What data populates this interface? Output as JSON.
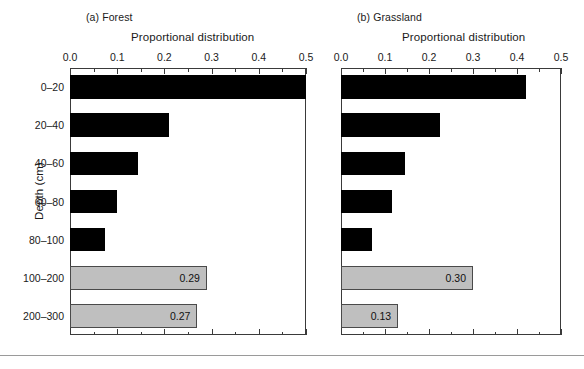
{
  "figure": {
    "y_axis_title": "Depth (cm)",
    "bottom_rule": "horizontal-rule"
  },
  "panels": [
    {
      "id": "a",
      "title": "(a) Forest",
      "x_axis_title": "Proportional distribution",
      "xticks": [
        "0.0",
        "0.1",
        "0.2",
        "0.3",
        "0.4",
        "0.5"
      ]
    },
    {
      "id": "b",
      "title": "(b) Grassland",
      "x_axis_title": "Proportional distribution",
      "xticks": [
        "0.0",
        "0.1",
        "0.2",
        "0.3",
        "0.4",
        "0.5"
      ]
    }
  ],
  "depth_labels": [
    "0–20",
    "20–40",
    "40–60",
    "60–80",
    "80–100",
    "100–200",
    "200–300"
  ],
  "bar_labels": {
    "forest_100_200": "0.29",
    "forest_200_300": "0.27",
    "grass_100_200": "0.30",
    "grass_200_300": "0.13"
  },
  "colors": {
    "measured_bar": "#000000",
    "estimated_bar": "#bfbfbf",
    "estimated_bar_border": "#4a4a4a",
    "axis": "#3a3a3a",
    "text": "#1a1a1a",
    "background": "#ffffff"
  },
  "chart_data": {
    "type": "bar",
    "orientation": "horizontal",
    "xlabel": "Proportional distribution",
    "ylabel": "Depth (cm)",
    "xlim": [
      0.0,
      0.5
    ],
    "xticks": [
      0.0,
      0.1,
      0.2,
      0.3,
      0.4,
      0.5
    ],
    "minor_ticks_per_interval": 1,
    "grid": false,
    "legend": null,
    "categories": [
      "0–20",
      "20–40",
      "40–60",
      "60–80",
      "80–100",
      "100–200",
      "200–300"
    ],
    "panels": [
      {
        "label": "(a) Forest",
        "values": [
          0.5,
          0.21,
          0.145,
          0.1,
          0.075,
          0.29,
          0.27
        ],
        "bar_fill": [
          "black",
          "black",
          "black",
          "black",
          "black",
          "gray",
          "gray"
        ],
        "data_labels": [
          null,
          null,
          null,
          null,
          null,
          "0.29",
          "0.27"
        ]
      },
      {
        "label": "(b) Grassland",
        "values": [
          0.42,
          0.225,
          0.145,
          0.115,
          0.07,
          0.3,
          0.13
        ],
        "bar_fill": [
          "black",
          "black",
          "black",
          "black",
          "black",
          "gray",
          "gray"
        ],
        "data_labels": [
          null,
          null,
          null,
          null,
          null,
          "0.30",
          "0.13"
        ]
      }
    ]
  }
}
